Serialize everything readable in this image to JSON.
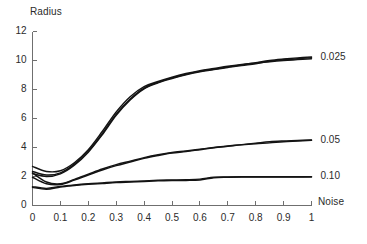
{
  "chart_data": {
    "type": "line",
    "title": "",
    "xlabel": "Noise",
    "ylabel": "Radius",
    "xlim": [
      0,
      1
    ],
    "ylim": [
      0,
      12
    ],
    "grid": false,
    "legend_position": "right-of-plot-line-ends",
    "x_ticks": [
      "0",
      "0.1",
      "0.2",
      "0.3",
      "0.4",
      "0.5",
      "0.6",
      "0.7",
      "0.8",
      "0.9",
      "1"
    ],
    "x_tick_values": [
      0,
      0.1,
      0.2,
      0.3,
      0.4,
      0.5,
      0.6,
      0.7,
      0.8,
      0.9,
      1
    ],
    "y_ticks": [
      "0",
      "2",
      "4",
      "6",
      "8",
      "10",
      "12"
    ],
    "y_tick_values": [
      0,
      2,
      4,
      6,
      8,
      10,
      12
    ],
    "x": [
      0,
      0.05,
      0.1,
      0.15,
      0.2,
      0.25,
      0.3,
      0.35,
      0.4,
      0.45,
      0.5,
      0.55,
      0.6,
      0.65,
      0.7,
      0.75,
      0.8,
      0.85,
      0.9,
      0.95,
      1
    ],
    "series": [
      {
        "name": "0.025",
        "label": "0.025",
        "color": "#141414",
        "traces": [
          {
            "name": "0.025-a",
            "values": [
              2.35,
              2.1,
              2.25,
              2.85,
              3.75,
              4.95,
              6.3,
              7.35,
              8.1,
              8.5,
              8.8,
              9.05,
              9.25,
              9.4,
              9.55,
              9.7,
              9.85,
              10.0,
              10.1,
              10.18,
              10.25
            ]
          },
          {
            "name": "0.025-b",
            "values": [
              2.7,
              2.35,
              2.4,
              2.95,
              3.85,
              5.1,
              6.45,
              7.5,
              8.2,
              8.55,
              8.85,
              9.1,
              9.3,
              9.45,
              9.6,
              9.72,
              9.82,
              9.92,
              10.0,
              10.06,
              10.12
            ]
          },
          {
            "name": "0.025-c",
            "values": [
              2.2,
              2.0,
              2.18,
              2.78,
              3.68,
              4.88,
              6.22,
              7.28,
              8.05,
              8.46,
              8.76,
              9.02,
              9.22,
              9.38,
              9.52,
              9.66,
              9.78,
              9.95,
              10.05,
              10.12,
              10.2
            ]
          }
        ]
      },
      {
        "name": "0.05",
        "label": "0.05",
        "color": "#141414",
        "traces": [
          {
            "name": "0.05-a",
            "values": [
              1.95,
              1.5,
              1.45,
              1.75,
              2.1,
              2.45,
              2.75,
              3.0,
              3.25,
              3.45,
              3.62,
              3.72,
              3.85,
              3.98,
              4.08,
              4.18,
              4.26,
              4.32,
              4.4,
              4.45,
              4.5
            ]
          },
          {
            "name": "0.05-b",
            "values": [
              2.25,
              1.62,
              1.5,
              1.8,
              2.16,
              2.52,
              2.82,
              3.06,
              3.3,
              3.5,
              3.66,
              3.76,
              3.88,
              4.0,
              4.1,
              4.2,
              4.3,
              4.4,
              4.45,
              4.48,
              4.52
            ]
          }
        ]
      },
      {
        "name": "0.10",
        "label": "0.10",
        "color": "#141414",
        "traces": [
          {
            "name": "0.10-a",
            "values": [
              1.25,
              1.12,
              1.28,
              1.38,
              1.46,
              1.52,
              1.58,
              1.62,
              1.66,
              1.7,
              1.72,
              1.73,
              1.76,
              1.92,
              1.95,
              1.96,
              1.96,
              1.96,
              1.96,
              1.96,
              1.97
            ]
          },
          {
            "name": "0.10-b",
            "values": [
              1.3,
              1.18,
              1.32,
              1.42,
              1.5,
              1.56,
              1.62,
              1.66,
              1.7,
              1.74,
              1.76,
              1.78,
              1.82,
              1.95,
              1.97,
              1.98,
              1.98,
              1.98,
              1.98,
              1.98,
              1.99
            ]
          }
        ]
      }
    ],
    "series_labels": [
      {
        "text": "0.025",
        "at_value": 10.2
      },
      {
        "text": "0.05",
        "at_value": 4.5
      },
      {
        "text": "0.10",
        "at_value": 2.0
      }
    ]
  },
  "caption": ""
}
